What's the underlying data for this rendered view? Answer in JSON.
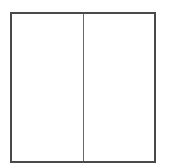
{
  "diagram": {
    "type": "split-rectangle",
    "orientation": "vertical-split",
    "panes": [
      {
        "id": "left",
        "label": ""
      },
      {
        "id": "right",
        "label": ""
      }
    ],
    "colors": {
      "border": "#4a4a4a",
      "divider": "#6a6a6a",
      "fill": "#ffffff",
      "background": "#ffffff"
    }
  }
}
